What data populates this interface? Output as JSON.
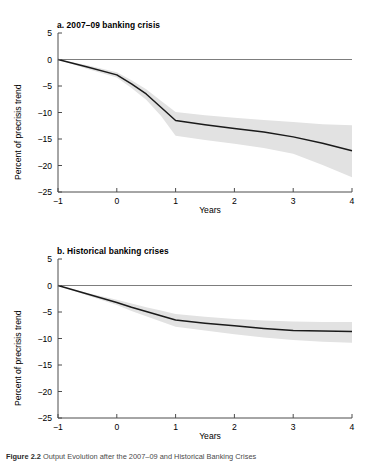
{
  "figure": {
    "caption_label": "Figure 2.2",
    "caption_text": "Output Evolution after the 2007–09 and Historical Banking Crises"
  },
  "panels": [
    {
      "id": "a",
      "title": "a. 2007–09 banking crisis",
      "xlabel": "Years",
      "ylabel": "Percent of precrisis trend"
    },
    {
      "id": "b",
      "title": "b. Historical banking crises",
      "xlabel": "Years",
      "ylabel": "Percent of precrisis trend"
    }
  ],
  "axis": {
    "xticks": [
      "−1",
      "0",
      "1",
      "2",
      "3",
      "4"
    ],
    "yticks": [
      "5",
      "0",
      "−5",
      "−10",
      "−15",
      "−20",
      "−25"
    ]
  },
  "colors": {
    "line": "#1a1a1a",
    "band": "#e2e2e2",
    "axis": "#4d4d4d",
    "zero_line": "#6e6e6e",
    "background": "#ffffff"
  },
  "chart_data": [
    {
      "type": "line",
      "title": "a. 2007–09 banking crisis",
      "xlabel": "Years",
      "ylabel": "Percent of precrisis trend",
      "xlim": [
        -1,
        4
      ],
      "ylim": [
        -25,
        5
      ],
      "xticks": [
        -1,
        0,
        1,
        2,
        3,
        4
      ],
      "yticks": [
        5,
        0,
        -5,
        -10,
        -15,
        -20,
        -25
      ],
      "grid": false,
      "legend": "none",
      "zero_reference_line": 0,
      "x": [
        -1,
        -0.5,
        0,
        0.25,
        0.5,
        0.75,
        1,
        1.5,
        2,
        2.5,
        3,
        3.5,
        4
      ],
      "series": [
        {
          "name": "Median output loss",
          "values": [
            0,
            -1.4,
            -2.9,
            -4.6,
            -6.5,
            -9.0,
            -11.5,
            -12.3,
            -13.0,
            -13.7,
            -14.6,
            -15.8,
            -17.2
          ]
        },
        {
          "name": "Confidence band upper",
          "values": [
            0,
            -1.1,
            -2.4,
            -3.9,
            -5.6,
            -7.8,
            -9.9,
            -10.5,
            -11.0,
            -11.4,
            -11.8,
            -12.2,
            -12.4
          ]
        },
        {
          "name": "Confidence band lower",
          "values": [
            0,
            -1.8,
            -3.4,
            -5.4,
            -7.6,
            -10.6,
            -14.4,
            -15.2,
            -15.9,
            -16.7,
            -17.8,
            -19.9,
            -22.2
          ]
        }
      ]
    },
    {
      "type": "line",
      "title": "b. Historical banking crises",
      "xlabel": "Years",
      "ylabel": "Percent of precrisis trend",
      "xlim": [
        -1,
        4
      ],
      "ylim": [
        -25,
        5
      ],
      "xticks": [
        -1,
        0,
        1,
        2,
        3,
        4
      ],
      "yticks": [
        5,
        0,
        -5,
        -10,
        -15,
        -20,
        -25
      ],
      "grid": false,
      "legend": "none",
      "zero_reference_line": 0,
      "x": [
        -1,
        -0.5,
        0,
        0.25,
        0.5,
        0.75,
        1,
        1.5,
        2,
        2.5,
        3,
        3.5,
        4
      ],
      "series": [
        {
          "name": "Median output loss",
          "values": [
            0,
            -1.6,
            -3.2,
            -4.1,
            -4.9,
            -5.7,
            -6.5,
            -7.1,
            -7.6,
            -8.1,
            -8.5,
            -8.6,
            -8.7
          ]
        },
        {
          "name": "Confidence band upper",
          "values": [
            0,
            -1.4,
            -2.7,
            -3.4,
            -4.1,
            -4.7,
            -5.4,
            -5.9,
            -6.3,
            -6.6,
            -6.8,
            -6.9,
            -6.9
          ]
        },
        {
          "name": "Confidence band lower",
          "values": [
            0,
            -1.9,
            -3.7,
            -4.8,
            -5.8,
            -6.8,
            -7.8,
            -8.5,
            -9.2,
            -9.8,
            -10.3,
            -10.6,
            -10.8
          ]
        }
      ]
    }
  ]
}
